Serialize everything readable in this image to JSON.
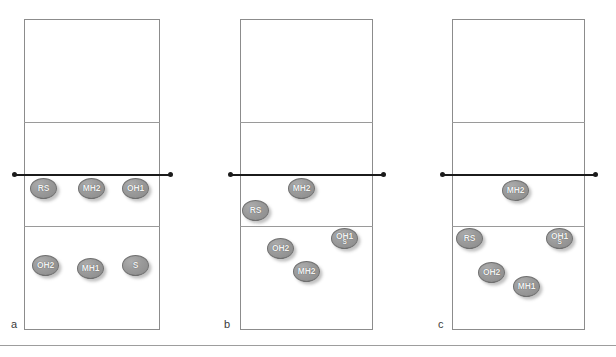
{
  "figure": {
    "width": 616,
    "height": 357,
    "background_color": "#ffffff",
    "court_line_color": "#8c8c8c",
    "net_color": "#1b1b1b",
    "player_fill_color": "#9a9a9a",
    "player_text_color": "#f2f2f2",
    "bottom_rule_color": "#9d9d9d"
  },
  "panels": [
    {
      "caption": "a",
      "caption_x": 11,
      "caption_y": 318,
      "court": {
        "x": 24,
        "y": 19,
        "w": 136,
        "h": 311
      },
      "lines": [
        {
          "name": "attack-line-far",
          "y": 122
        },
        {
          "name": "attack-line-near",
          "y": 226
        }
      ],
      "net": {
        "y": 174,
        "x1": 14,
        "x2": 170
      },
      "players": [
        {
          "label": "RS",
          "x": 30,
          "y": 178
        },
        {
          "label": "MH2",
          "x": 78,
          "y": 178
        },
        {
          "label": "OH1",
          "x": 122,
          "y": 178
        },
        {
          "label": "OH2",
          "x": 32,
          "y": 255
        },
        {
          "label": "MH1",
          "x": 77,
          "y": 258
        },
        {
          "label": "S",
          "x": 122,
          "y": 255
        }
      ]
    },
    {
      "caption": "b",
      "caption_x": 224,
      "caption_y": 318,
      "court": {
        "x": 240,
        "y": 19,
        "w": 133,
        "h": 311
      },
      "lines": [
        {
          "name": "attack-line-far",
          "y": 122
        },
        {
          "name": "attack-line-near",
          "y": 226
        }
      ],
      "net": {
        "y": 174,
        "x1": 230,
        "x2": 383
      },
      "players": [
        {
          "label": "MH2",
          "x": 288,
          "y": 178
        },
        {
          "label": "RS",
          "x": 242,
          "y": 200
        },
        {
          "label": "OH1",
          "x": 331,
          "y": 228,
          "stacked_label": "S"
        },
        {
          "label": "OH2",
          "x": 267,
          "y": 238
        },
        {
          "label": "MH2",
          "x": 293,
          "y": 261
        }
      ]
    },
    {
      "caption": "c",
      "caption_x": 438,
      "caption_y": 318,
      "court": {
        "x": 452,
        "y": 19,
        "w": 133,
        "h": 311
      },
      "lines": [
        {
          "name": "attack-line-far",
          "y": 122
        },
        {
          "name": "attack-line-near",
          "y": 226
        }
      ],
      "net": {
        "y": 174,
        "x1": 442,
        "x2": 595
      },
      "players": [
        {
          "label": "MH2",
          "x": 502,
          "y": 180
        },
        {
          "label": "RS",
          "x": 456,
          "y": 228
        },
        {
          "label": "OH1",
          "x": 546,
          "y": 228,
          "stacked_label": "S"
        },
        {
          "label": "OH2",
          "x": 478,
          "y": 262
        },
        {
          "label": "MH1",
          "x": 513,
          "y": 276
        }
      ]
    }
  ]
}
